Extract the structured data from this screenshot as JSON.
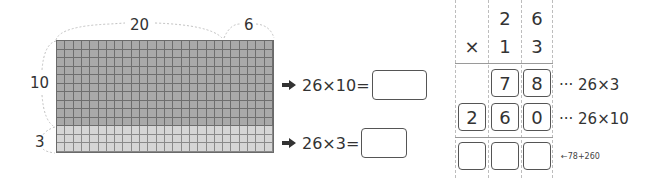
{
  "area_model": {
    "width_labels": {
      "tens": "20",
      "ones": "6"
    },
    "height_labels": {
      "tens": "10",
      "ones": "3"
    },
    "columns": 26,
    "rows_top": 10,
    "rows_bottom": 3,
    "colors": {
      "top_block": "#a9a9a9",
      "bottom_block": "#d6d6d6",
      "grid_line": "#6e6e6e"
    }
  },
  "equations": [
    {
      "icon": "arrow-right-icon",
      "expression": "26×10=",
      "answer": ""
    },
    {
      "icon": "arrow-right-icon",
      "expression": "26×3=",
      "answer": ""
    }
  ],
  "vertical_multiplication": {
    "operator": "×",
    "multiplicand": [
      "2",
      "6"
    ],
    "multiplier": [
      "1",
      "3"
    ],
    "partial_products": [
      {
        "digits": [
          "",
          "7",
          "8"
        ],
        "note": "··· 26×3"
      },
      {
        "digits": [
          "2",
          "6",
          "0"
        ],
        "note": "··· 26×10"
      }
    ],
    "result": {
      "digits": [
        "",
        "",
        ""
      ],
      "hint": "←78+260"
    }
  }
}
